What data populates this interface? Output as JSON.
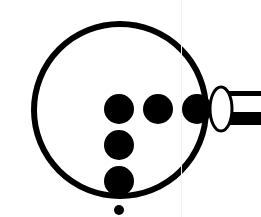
{
  "figure": {
    "colors": {
      "ink": "#000000",
      "background": "#ffffff"
    },
    "lens": {
      "cx": 120,
      "cy": 110,
      "r": 86,
      "stroke_width": 6
    },
    "dots": [
      {
        "cx": 119,
        "cy": 109,
        "r": 15
      },
      {
        "cx": 158,
        "cy": 109,
        "r": 15
      },
      {
        "cx": 197,
        "cy": 109,
        "r": 15
      },
      {
        "cx": 119,
        "cy": 145,
        "r": 15
      },
      {
        "cx": 119,
        "cy": 181,
        "r": 15
      },
      {
        "cx": 119,
        "cy": 210,
        "r": 5
      }
    ],
    "handle": {
      "collar": {
        "cx": 221,
        "cy": 109,
        "rx": 11,
        "ry": 22
      }
    }
  }
}
